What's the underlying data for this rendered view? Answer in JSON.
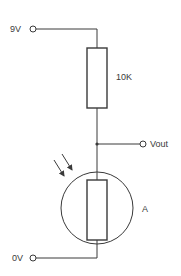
{
  "diagram": {
    "type": "voltage divider circuit with light-dependent resistor",
    "terminals": {
      "supply": {
        "label": "9V"
      },
      "output": {
        "label": "Vout"
      },
      "ground": {
        "label": "0V"
      }
    },
    "components": {
      "fixed_resistor": {
        "label": "10K"
      },
      "ldr": {
        "label": "A",
        "light_arrows": 2
      }
    },
    "colors": {
      "line": "#3a3a3a",
      "background": "#ffffff"
    }
  }
}
